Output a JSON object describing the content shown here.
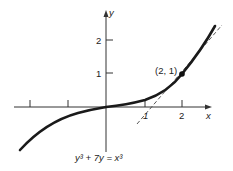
{
  "figure": {
    "equation": "y³ + 7y = x³",
    "point_label": "(2, 1)",
    "x_axis_label": "x",
    "y_axis_label": "y",
    "x_tick_labels": [
      "1",
      "2"
    ],
    "y_tick_labels": [
      "1",
      "2"
    ],
    "tangent_slope": 1.2,
    "point": [
      2,
      1
    ],
    "colors": {
      "curve": "#1a1a1a",
      "axis": "#333333",
      "tangent": "#444444"
    }
  }
}
